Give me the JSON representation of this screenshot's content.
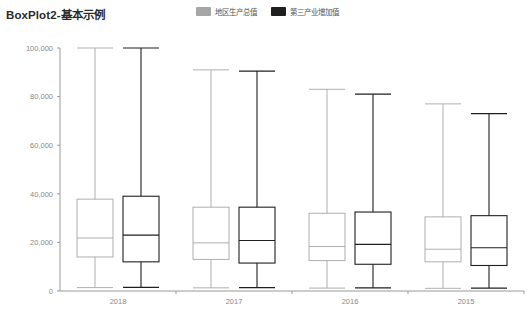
{
  "title": "BoxPlot2-基本示例",
  "legend": {
    "position": "top-center",
    "items": [
      {
        "label": "地区生产总值",
        "color": "#a6a6a6",
        "icon": "legend-swatch"
      },
      {
        "label": "第三产业增加值",
        "color": "#1f1f1f",
        "icon": "legend-swatch"
      }
    ]
  },
  "chart_data": {
    "type": "box",
    "title": "BoxPlot2-基本示例",
    "xlabel": "",
    "ylabel": "",
    "categories": [
      "2018",
      "2017",
      "2016",
      "2015"
    ],
    "ylim": [
      0,
      100000
    ],
    "yticks": [
      0,
      20000,
      40000,
      60000,
      80000,
      100000
    ],
    "ytick_labels": [
      "0",
      "20,000",
      "40,000",
      "60,000",
      "80,000",
      "100,000"
    ],
    "grid": false,
    "series": [
      {
        "name": "地区生产总值",
        "color": "#a6a6a6",
        "boxes": [
          {
            "category": "2018",
            "min": 1400,
            "q1": 14000,
            "median": 21800,
            "q3": 37800,
            "max": 100000
          },
          {
            "category": "2017",
            "min": 1300,
            "q1": 13000,
            "median": 19800,
            "q3": 34500,
            "max": 91000
          },
          {
            "category": "2016",
            "min": 1200,
            "q1": 12500,
            "median": 18300,
            "q3": 32000,
            "max": 83000
          },
          {
            "category": "2015",
            "min": 1100,
            "q1": 12000,
            "median": 17200,
            "q3": 30500,
            "max": 77000
          }
        ]
      },
      {
        "name": "第三产业增加值",
        "color": "#1f1f1f",
        "boxes": [
          {
            "category": "2018",
            "min": 1500,
            "q1": 12000,
            "median": 23000,
            "q3": 39000,
            "max": 100000
          },
          {
            "category": "2017",
            "min": 1400,
            "q1": 11500,
            "median": 20800,
            "q3": 34500,
            "max": 90500
          },
          {
            "category": "2016",
            "min": 1300,
            "q1": 11000,
            "median": 19200,
            "q3": 32500,
            "max": 81000
          },
          {
            "category": "2015",
            "min": 1200,
            "q1": 10500,
            "median": 17800,
            "q3": 31000,
            "max": 73000
          }
        ]
      }
    ]
  }
}
